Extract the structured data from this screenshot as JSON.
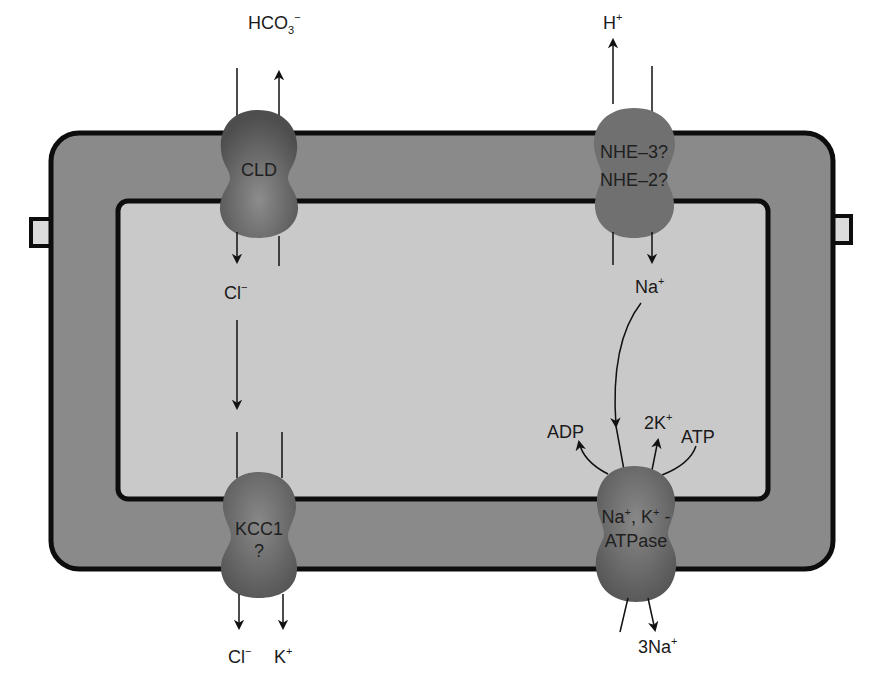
{
  "colors": {
    "membrane": "#8a8a8a",
    "cytoplasm": "#c8c8c8",
    "outline": "#0d0d0d",
    "protein": "#6e6e6e",
    "background": "#ffffff",
    "tight_junction": "#d6d6d6"
  },
  "transporters": {
    "cld": {
      "label": "CLD"
    },
    "nhe": {
      "line1": "NHE–3?",
      "line2": "NHE–2?"
    },
    "kcc1": {
      "line1": "KCC1",
      "line2": "?"
    },
    "atpase": {
      "line1_a": "Na",
      "line1_b": ", K",
      "line1_c": " -",
      "line2": "ATPase",
      "sup_plus": "+"
    }
  },
  "ions": {
    "hco3": {
      "base": "HCO",
      "sub": "3",
      "sup": "−"
    },
    "h_plus": {
      "base": "H",
      "sup": "+"
    },
    "cl_inside": {
      "base": "Cl",
      "sup": "−"
    },
    "na_inside": {
      "base": "Na",
      "sup": "+"
    },
    "adp": {
      "text": "ADP"
    },
    "two_k": {
      "base": "2K",
      "sup": "+"
    },
    "atp": {
      "text": "ATP"
    },
    "cl_out": {
      "base": "Cl",
      "sup": "−"
    },
    "k_out": {
      "base": "K",
      "sup": "+"
    },
    "three_na": {
      "base": "3Na",
      "sup": "+"
    }
  }
}
